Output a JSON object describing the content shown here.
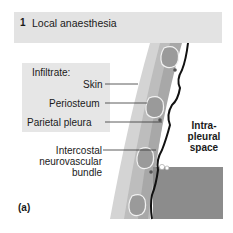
{
  "figure": {
    "panel_number": "1",
    "title": "Local anaesthesia",
    "panel_letter": "(a)"
  },
  "labels": {
    "infiltrate_heading": "Infiltrate:",
    "skin": "Skin",
    "periosteum": "Periosteum",
    "parietal_pleura": "Parietal pleura",
    "intercostal_line1": "Intercostal",
    "intercostal_line2": "neurovascular",
    "intercostal_line3": "bundle",
    "intrapleural_line1": "Intra-",
    "intrapleural_line2": "pleural",
    "intrapleural_line3": "space"
  },
  "colors": {
    "header_band": "#e3e3e3",
    "label_box": "#e6e6e6",
    "skin_layer": "#c9c9c9",
    "rib": "#9a9a9a",
    "pleura_line": "#111111",
    "lung": "#8c8c8c"
  }
}
